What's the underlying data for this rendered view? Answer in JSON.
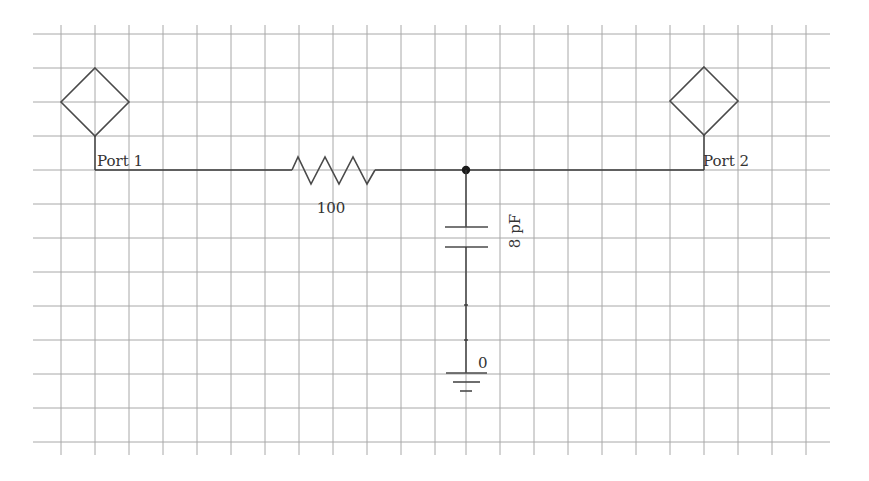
{
  "diagram": {
    "type": "circuit-schematic",
    "grid": {
      "visible": true,
      "spacing_px": 34
    },
    "ports": [
      {
        "id": "port1",
        "label": "Port 1"
      },
      {
        "id": "port2",
        "label": "Port 2"
      }
    ],
    "components": [
      {
        "id": "R1",
        "kind": "resistor",
        "value_label": "100"
      },
      {
        "id": "C1",
        "kind": "capacitor",
        "value_label": "8 pF"
      },
      {
        "id": "GND",
        "kind": "ground",
        "node_label": "0"
      }
    ],
    "connections": [
      "Port 1 — R1 (100) — node N1 — Port 2",
      "node N1 — C1 (8 pF) — ground (0)"
    ],
    "colors": {
      "grid": "#a8a8a8",
      "wire": "#3a3a3a",
      "text": "#333333",
      "background": "#ffffff"
    }
  }
}
